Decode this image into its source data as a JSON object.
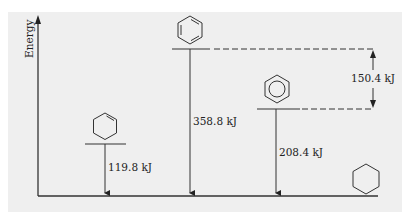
{
  "diagram": {
    "type": "energy-level-diagram",
    "axis_label": "Energy",
    "levels": [
      {
        "name": "cyclohexene",
        "structure": "cyclohexene-icon",
        "energy_label": "119.8 kJ"
      },
      {
        "name": "hypothetical-cyclohexatriene",
        "structure": "kekule-benzene-icon",
        "energy_label": "358.8 kJ"
      },
      {
        "name": "benzene",
        "structure": "aromatic-benzene-icon",
        "energy_label": "208.4 kJ"
      },
      {
        "name": "cyclohexane",
        "structure": "cyclohexane-icon",
        "energy_label": ""
      }
    ],
    "difference_label": "150.4 kJ",
    "colors": {
      "panel": "#efefef",
      "line": "#333333"
    }
  }
}
